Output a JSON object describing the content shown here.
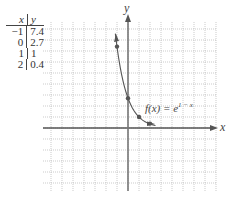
{
  "table": {
    "headers": [
      "x",
      "y"
    ],
    "rows": [
      [
        "−1",
        "7.4"
      ],
      [
        "0",
        "2.7"
      ],
      [
        "1",
        "1"
      ],
      [
        "2",
        "0.4"
      ]
    ]
  },
  "axes": {
    "x_label": "x",
    "y_label": "y"
  },
  "function_label": "f(x) = e",
  "function_exponent": "1 − x",
  "colors": {
    "curve": "#555555",
    "grid": "#aaaaaa",
    "axis": "#555555"
  },
  "chart_data": {
    "type": "line",
    "title": "",
    "function": "f(x) = e^(1-x)",
    "x": [
      -1,
      0,
      1,
      2
    ],
    "values": [
      7.4,
      2.7,
      1,
      0.4
    ],
    "xlabel": "x",
    "ylabel": "y",
    "xlim": [
      -8,
      8
    ],
    "ylim": [
      -6,
      9
    ],
    "grid": true,
    "legend": "none"
  }
}
